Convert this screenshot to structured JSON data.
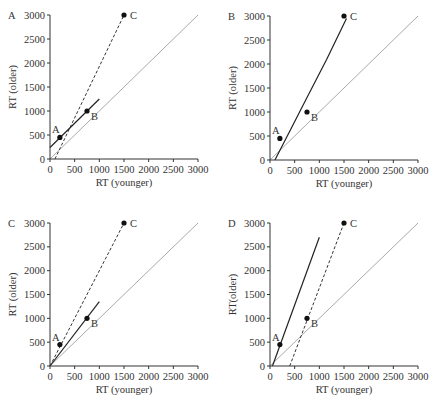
{
  "chart_data": [
    {
      "panel": "A",
      "type": "scatter",
      "xlabel": "RT (younger)",
      "ylabel": "RT (older)",
      "xlim": [
        0,
        3000
      ],
      "ylim": [
        0,
        3000
      ],
      "xticks": [
        0,
        500,
        1000,
        1500,
        2000,
        2500,
        3000
      ],
      "yticks": [
        0,
        500,
        1000,
        1500,
        2000,
        2500,
        3000
      ],
      "points": [
        {
          "label": "A",
          "x": 200,
          "y": 450
        },
        {
          "label": "B",
          "x": 750,
          "y": 1000
        },
        {
          "label": "C",
          "x": 1500,
          "y": 3000
        }
      ],
      "lines": [
        {
          "style": "gray",
          "from": [
            0,
            0
          ],
          "to": [
            3000,
            3000
          ]
        },
        {
          "style": "solid",
          "from": [
            0,
            240
          ],
          "to": [
            1000,
            1250
          ]
        },
        {
          "style": "dashed",
          "from": [
            100,
            0
          ],
          "to": [
            1500,
            3000
          ]
        }
      ]
    },
    {
      "panel": "B",
      "type": "scatter",
      "xlabel": "RT (younger)",
      "ylabel": "RT (older)",
      "xlim": [
        0,
        3000
      ],
      "ylim": [
        0,
        3000
      ],
      "xticks": [
        0,
        500,
        1000,
        1500,
        2000,
        2500,
        3000
      ],
      "yticks": [
        0,
        500,
        1000,
        1500,
        2000,
        2500,
        3000
      ],
      "points": [
        {
          "label": "A",
          "x": 200,
          "y": 450
        },
        {
          "label": "B",
          "x": 750,
          "y": 1000
        },
        {
          "label": "C",
          "x": 1500,
          "y": 3000
        }
      ],
      "lines": [
        {
          "style": "gray",
          "from": [
            0,
            0
          ],
          "to": [
            3000,
            3000
          ]
        },
        {
          "style": "solid-curve",
          "points": [
            [
              100,
              0
            ],
            [
              400,
              600
            ],
            [
              750,
              1300
            ],
            [
              1150,
              2100
            ],
            [
              1550,
              2950
            ]
          ]
        }
      ]
    },
    {
      "panel": "C",
      "type": "scatter",
      "xlabel": "RT (younger)",
      "ylabel": "RT (older)",
      "xlim": [
        0,
        3000
      ],
      "ylim": [
        0,
        3000
      ],
      "xticks": [
        0,
        500,
        1000,
        1500,
        2000,
        2500,
        3000
      ],
      "yticks": [
        0,
        500,
        1000,
        1500,
        2000,
        2500,
        3000
      ],
      "points": [
        {
          "label": "A",
          "x": 200,
          "y": 450
        },
        {
          "label": "B",
          "x": 750,
          "y": 1000
        },
        {
          "label": "C",
          "x": 1500,
          "y": 3000
        }
      ],
      "lines": [
        {
          "style": "gray",
          "from": [
            0,
            0
          ],
          "to": [
            3000,
            3000
          ]
        },
        {
          "style": "solid",
          "from": [
            0,
            0
          ],
          "to": [
            1000,
            1350
          ]
        },
        {
          "style": "dashed",
          "from": [
            0,
            0
          ],
          "to": [
            1500,
            3000
          ]
        }
      ]
    },
    {
      "panel": "D",
      "type": "scatter",
      "xlabel": "RT (younger)",
      "ylabel": "RT(older)",
      "xlim": [
        0,
        3000
      ],
      "ylim": [
        0,
        3000
      ],
      "xticks": [
        0,
        500,
        1000,
        1500,
        2000,
        2500,
        3000
      ],
      "yticks": [
        0,
        500,
        1000,
        1500,
        2000,
        2500,
        3000
      ],
      "points": [
        {
          "label": "A",
          "x": 200,
          "y": 450
        },
        {
          "label": "B",
          "x": 750,
          "y": 1000
        },
        {
          "label": "C",
          "x": 1500,
          "y": 3000
        }
      ],
      "lines": [
        {
          "style": "gray",
          "from": [
            0,
            0
          ],
          "to": [
            3000,
            3000
          ]
        },
        {
          "style": "solid",
          "from": [
            50,
            0
          ],
          "to": [
            1000,
            2700
          ]
        },
        {
          "style": "dashed",
          "from": [
            400,
            0
          ],
          "to": [
            1500,
            3000
          ]
        }
      ]
    }
  ],
  "colors": {
    "axis": "#333333",
    "point": "#111111",
    "solid_line": "#222222",
    "dashed_line": "#333333",
    "identity_line": "#aaaaaa"
  }
}
